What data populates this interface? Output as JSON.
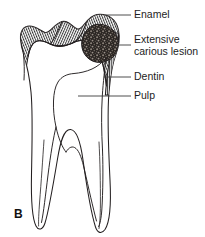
{
  "figure": {
    "panel_letter": "B",
    "background_color": "#ffffff",
    "ink_color": "#231f20",
    "label_color": "#1d1d1d"
  },
  "labels": [
    {
      "id": "enamel",
      "text": "Enamel",
      "lines": [
        "Enamel"
      ],
      "text_x": 134,
      "text_y": 15,
      "leader": {
        "x1": 105,
        "y1": 15,
        "x2": 131,
        "y2": 15
      }
    },
    {
      "id": "carious-lesion",
      "text": "Extensive carious lesion",
      "lines": [
        "Extensive",
        "carious lesion"
      ],
      "text_x": 134,
      "text_y": 45,
      "leader": {
        "x1": 116,
        "y1": 45,
        "x2": 131,
        "y2": 45
      }
    },
    {
      "id": "dentin",
      "text": "Dentin",
      "lines": [
        "Dentin"
      ],
      "text_x": 134,
      "text_y": 77,
      "leader": {
        "x1": 104,
        "y1": 77,
        "x2": 131,
        "y2": 77
      }
    },
    {
      "id": "pulp",
      "text": "Pulp",
      "lines": [
        "Pulp"
      ],
      "text_x": 134,
      "text_y": 96,
      "leader": {
        "x1": 78,
        "y1": 96,
        "x2": 131,
        "y2": 96
      }
    }
  ],
  "anatomy": {
    "enamel_cap_name": "enamel-cap",
    "dentin_body_name": "dentin-body",
    "pulp_chamber_name": "pulp-chamber",
    "lesion_name": "extensive-carious-lesion",
    "root_left_name": "root-left",
    "root_right_name": "root-right"
  },
  "styles": {
    "enamel_hatch": "radial-line-hatching",
    "lesion_fill": "dark-stipple",
    "outline_weight": 1.05
  }
}
